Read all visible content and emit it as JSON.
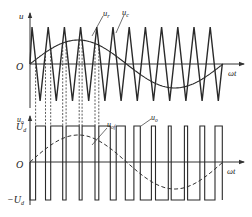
{
  "chart_data": [
    {
      "type": "line",
      "title": "",
      "ylabel": "u",
      "xlabel": "ωt",
      "origin_label": "O",
      "series": [
        {
          "name": "u_r",
          "label": "u",
          "sub": "r",
          "kind": "sine",
          "description": "sinusoidal modulating (reference) wave, one full period",
          "amplitude_ratio": 0.65
        },
        {
          "name": "u_c",
          "label": "u",
          "sub": "c",
          "kind": "triangle",
          "description": "triangular carrier wave",
          "periods": 12,
          "amplitude_ratio": 1.0
        }
      ]
    },
    {
      "type": "line",
      "title": "",
      "ylabel": "u_o",
      "xlabel": "ωt",
      "origin_label": "O",
      "y_ticks": [
        "U_d",
        "O",
        "-U_d"
      ],
      "series": [
        {
          "name": "u_o",
          "label": "u",
          "sub": "o",
          "kind": "bipolar PWM pulse train",
          "levels": [
            1,
            -1
          ]
        },
        {
          "name": "u_of",
          "label": "u",
          "sub": "of",
          "kind": "fundamental (dashed sine)"
        }
      ]
    }
  ],
  "labels": {
    "top_y": "u",
    "top_origin": "O",
    "top_x": "ωt",
    "ur_main": "u",
    "ur_sub": "r",
    "uc_main": "u",
    "uc_sub": "c",
    "bot_y_main": "u",
    "bot_y_sub": "o",
    "ud_main": "U",
    "ud_sub": "d",
    "neg_ud_main": "−U",
    "neg_ud_sub": "d",
    "bot_origin": "O",
    "bot_x": "ωt",
    "uof_main": "u",
    "uof_sub": "of",
    "uo_main": "u",
    "uo_sub": "o"
  },
  "geometry": {
    "x0": 30,
    "x_end": 223,
    "top_zero": 64,
    "top_amp": 37,
    "sine_amp": 24,
    "carrier_first_peak": 32,
    "carrier_period": 16.2,
    "carrier_peaks": 12,
    "bot_zero": 162,
    "bot_high": 126,
    "bot_low": 200,
    "fund_amp": 27
  }
}
